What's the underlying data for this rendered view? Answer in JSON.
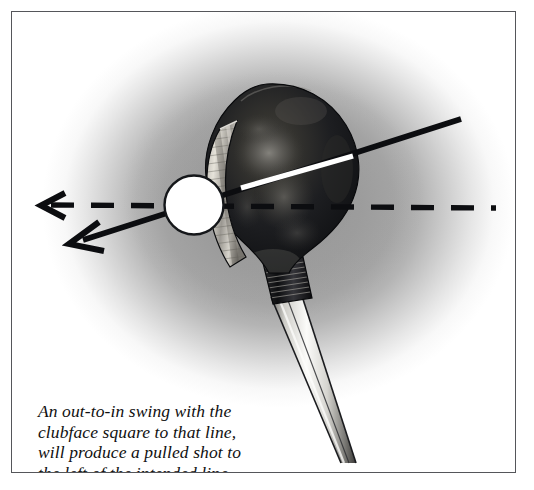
{
  "figure": {
    "kind": "golf-swing-path-illustration",
    "frame": {
      "border_color": "#55565a",
      "background_color": "#ffffff",
      "vignette_color": "#9b9b9b"
    }
  },
  "caption": {
    "lines": [
      "An out-to-in swing with the",
      "clubface square to that line,",
      "will produce a pulled shot to",
      "the left of the intended line"
    ],
    "full_text": "An out-to-in swing with the clubface square to that line, will produce a pulled shot to the left of the intended line",
    "style": "italic-serif",
    "color": "#101010"
  },
  "elements": {
    "golf_ball": {
      "label": "golf-ball",
      "fill": "#ffffff",
      "stroke": "#15171a",
      "center_x": 193,
      "center_y": 204,
      "radius": 29
    },
    "club_head": {
      "label": "driver-clubhead",
      "body_color": "#15161a",
      "crown_highlight_color": "#6f6e6c",
      "description": "pear-shaped persimmon wood head, dark with mottled grain highlights"
    },
    "club_face": {
      "label": "clubface",
      "color": "#d8d6d0",
      "description": "bright scored metallic insert facing the ball, square to the swing line"
    },
    "ferrule": {
      "label": "whipping-ferrule",
      "color": "#101114",
      "description": "dark banded whipping where the shaft enters the hosel"
    },
    "shaft": {
      "label": "club-shaft",
      "color": "#e8e8e6",
      "edge_color": "#1a1b1e",
      "description": "bright chrome shaft angling down to the lower right"
    },
    "swing_path_line": {
      "label": "out-to-in-swing-path",
      "color": "#0c0d10",
      "style": "solid",
      "arrow": "open-chevron",
      "from_x": 460,
      "from_y": 118,
      "to_x": 68,
      "to_y": 243,
      "note": "solid line running from upper right through the ball to the lower left"
    },
    "clubface_alignment_line": {
      "label": "clubface-square-line",
      "color": "#ffffff",
      "style": "solid",
      "from_x": 242,
      "from_y": 186,
      "to_x": 351,
      "to_y": 155,
      "note": "white segment across the clubhead showing the face square to the swing path"
    },
    "target_line": {
      "label": "intended-target-line",
      "color": "#0c0d10",
      "style": "dashed",
      "arrow": "open-chevron",
      "from_x": 495,
      "from_y": 207,
      "to_x": 38,
      "to_y": 204,
      "note": "horizontal dashed line marking the intended line of flight"
    }
  }
}
